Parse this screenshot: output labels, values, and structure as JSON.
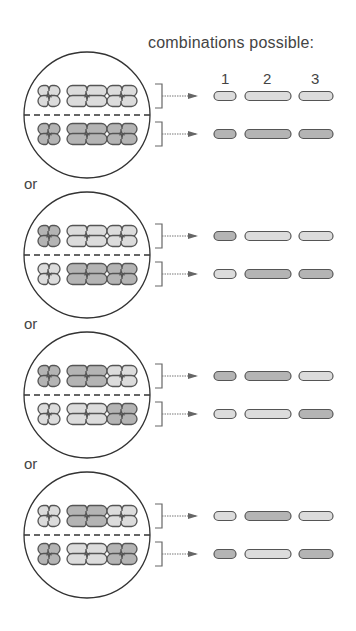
{
  "title": "combinations possible:",
  "column_labels": [
    "1",
    "2",
    "3"
  ],
  "separator_label": "or",
  "colors": {
    "light": "#dcdcdc",
    "dark": "#b4b4b4",
    "outline": "#555555",
    "line": "#333333"
  },
  "combinations": [
    {
      "top": [
        "light",
        "light",
        "light"
      ],
      "bottom": [
        "dark",
        "dark",
        "dark"
      ]
    },
    {
      "top": [
        "dark",
        "light",
        "light"
      ],
      "bottom": [
        "light",
        "dark",
        "dark"
      ]
    },
    {
      "top": [
        "dark",
        "dark",
        "light"
      ],
      "bottom": [
        "light",
        "light",
        "dark"
      ]
    },
    {
      "top": [
        "light",
        "dark",
        "light"
      ],
      "bottom": [
        "dark",
        "light",
        "dark"
      ]
    }
  ]
}
